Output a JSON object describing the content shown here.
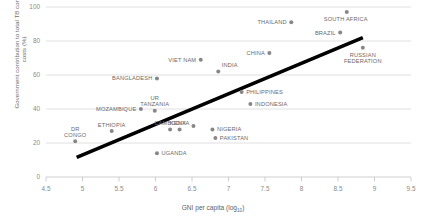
{
  "chart_data": {
    "type": "scatter",
    "title": "",
    "xlabel": "GNI per capita (log",
    "xlabel_sub": "10",
    "xlabel_suffix": ")",
    "ylabel": "Government contribution to total TB control costs (%)",
    "xlim": [
      4.5,
      9.5
    ],
    "ylim": [
      0,
      100
    ],
    "xticks": [
      "4.5",
      "5",
      "5.5",
      "6",
      "6.5",
      "7",
      "7.5",
      "8",
      "8.5",
      "9",
      "9.5"
    ],
    "xtick_values": [
      4.5,
      5,
      5.5,
      6,
      6.5,
      7,
      7.5,
      8,
      8.5,
      9,
      9.5
    ],
    "yticks": [
      "0",
      "20",
      "40",
      "60",
      "80",
      "100"
    ],
    "ytick_values": [
      0,
      20,
      40,
      60,
      80,
      100
    ],
    "grid": "horizontal",
    "legend": "none",
    "point_color": "#878787",
    "line_color": "#000000",
    "grid_color": "#d8d8d8",
    "trendline": {
      "x0": 4.92,
      "y0": 11.5,
      "x1": 8.84,
      "y1": 82.0
    },
    "points": [
      {
        "label": "DR CONGO",
        "x": 4.9,
        "y": 21,
        "label_pos": "above",
        "label_lines": [
          "DR",
          "CONGO"
        ]
      },
      {
        "label": "ETHIOPIA",
        "x": 5.4,
        "y": 27,
        "label_pos": "above",
        "label_lines": [
          "ETHIOPIA"
        ]
      },
      {
        "label": "MOZAMBIQUE",
        "x": 5.8,
        "y": 40,
        "label_pos": "left",
        "label_lines": [
          "MOZAMBIQUE"
        ]
      },
      {
        "label": "UR TANZANIA",
        "x": 5.99,
        "y": 39,
        "label_pos": "above",
        "label_lines": [
          "UR",
          "TANZANIA"
        ]
      },
      {
        "label": "UGANDA",
        "x": 6.02,
        "y": 14,
        "label_pos": "right",
        "label_lines": [
          "UGANDA"
        ]
      },
      {
        "label": "BANGLADESH",
        "x": 6.02,
        "y": 58,
        "label_pos": "left",
        "label_lines": [
          "BANGLADESH"
        ]
      },
      {
        "label": "CAMBODIA",
        "x": 6.2,
        "y": 28,
        "label_pos": "above",
        "label_lines": [
          "CAMBODIA"
        ]
      },
      {
        "label": "KENYA",
        "x": 6.33,
        "y": 28,
        "label_pos": "above",
        "label_lines": [
          "KENYA"
        ]
      },
      {
        "label": "KENYA2",
        "x": 6.52,
        "y": 30,
        "label_pos": "none",
        "label_lines": []
      },
      {
        "label": "VIET NAM",
        "x": 6.62,
        "y": 69,
        "label_pos": "left",
        "label_lines": [
          "VIET NAM"
        ]
      },
      {
        "label": "NIGERIA",
        "x": 6.78,
        "y": 28,
        "label_pos": "right",
        "label_lines": [
          "NIGERIA"
        ]
      },
      {
        "label": "PAKISTAN",
        "x": 6.82,
        "y": 23,
        "label_pos": "right",
        "label_lines": [
          "PAKISTAN"
        ]
      },
      {
        "label": "INDIA",
        "x": 6.86,
        "y": 62,
        "label_pos": "above-right",
        "label_lines": [
          "INDIA"
        ]
      },
      {
        "label": "PHILIPPINES",
        "x": 7.18,
        "y": 50,
        "label_pos": "right",
        "label_lines": [
          "PHILIPPINES"
        ]
      },
      {
        "label": "INDONESIA",
        "x": 7.3,
        "y": 43,
        "label_pos": "right",
        "label_lines": [
          "INDONESIA"
        ]
      },
      {
        "label": "CHINA",
        "x": 7.56,
        "y": 73,
        "label_pos": "left",
        "label_lines": [
          "CHINA"
        ]
      },
      {
        "label": "THAILAND",
        "x": 7.86,
        "y": 91,
        "label_pos": "left",
        "label_lines": [
          "THAILAND"
        ]
      },
      {
        "label": "BRAZIL",
        "x": 8.53,
        "y": 85,
        "label_pos": "left",
        "label_lines": [
          "BRAZIL"
        ]
      },
      {
        "label": "SOUTH AFRICA",
        "x": 8.62,
        "y": 97,
        "label_pos": "below-right",
        "label_lines": [
          "SOUTH AFRICA"
        ]
      },
      {
        "label": "RUSSIAN FEDERATION",
        "x": 8.84,
        "y": 76,
        "label_pos": "below",
        "label_lines": [
          "RUSSIAN",
          "FEDERATION"
        ]
      }
    ]
  }
}
